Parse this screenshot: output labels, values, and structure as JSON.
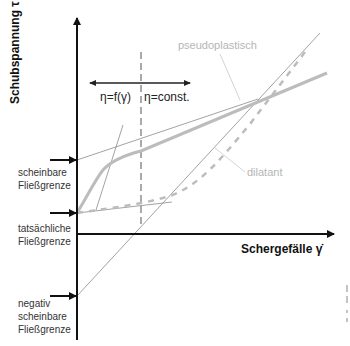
{
  "diagram": {
    "type": "flow-curve",
    "y_axis": {
      "label": "Schubspannung τ"
    },
    "x_axis": {
      "label": "Schergefälle γ̇"
    },
    "regions": {
      "left": "η=f(γ)",
      "right": "η=const."
    },
    "curves": [
      {
        "name": "pseudoplastisch",
        "color": "#bcbcbc"
      },
      {
        "name": "dilatant",
        "color": "#bcbcbc"
      }
    ],
    "yield_points": [
      {
        "label_line1": "scheinbare",
        "label_line2": "Fließgrenze"
      },
      {
        "label_line1": "tatsächliche",
        "label_line2": "Fließgrenze"
      },
      {
        "label_line1": "negativ",
        "label_line2": "scheinbare",
        "label_line3": "Fließgrenze"
      }
    ]
  },
  "colors": {
    "axis": "#111111",
    "curve": "#bcbcbc",
    "thin_line": "#888888",
    "label_gray": "#b5b5b5"
  }
}
